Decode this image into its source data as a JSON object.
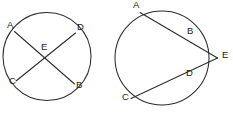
{
  "figure": {
    "background_color": "#ffffff",
    "stroke_color": "#2b2b2b",
    "label_color": "#1a1a1a",
    "canvas": {
      "width": 233,
      "height": 113
    }
  },
  "left_diagram": {
    "name": "intersecting-chords-circle",
    "circle": {
      "cx": 47,
      "cy": 56.5,
      "r": 44
    },
    "chords": [
      {
        "name": "chord-AB",
        "from": {
          "point": "A",
          "x": 14.5,
          "y": 31.5
        },
        "to": {
          "point": "B",
          "x": 74.5,
          "y": 84.0
        }
      },
      {
        "name": "chord-CD",
        "from": {
          "point": "C",
          "x": 16.0,
          "y": 81.0
        },
        "to": {
          "point": "D",
          "x": 75.5,
          "y": 33.0
        }
      }
    ],
    "intersection": {
      "point": "E",
      "x": 45.0,
      "y": 57.0
    },
    "labels": [
      {
        "text": "A",
        "x": 7,
        "y": 21
      },
      {
        "text": "D",
        "x": 77,
        "y": 23
      },
      {
        "text": "E",
        "x": 41,
        "y": 43
      },
      {
        "text": "C",
        "x": 9,
        "y": 77
      },
      {
        "text": "B",
        "x": 76,
        "y": 81
      }
    ]
  },
  "right_diagram": {
    "name": "two-secants-external-point-circle",
    "circle": {
      "cx": 162,
      "cy": 58,
      "r": 47
    },
    "external_point": {
      "point": "E",
      "x": 217.5,
      "y": 58.0
    },
    "secants": [
      {
        "name": "secant-AE-through-B",
        "near": {
          "point": "B",
          "x": 187.0,
          "y": 38.5
        },
        "far": {
          "point": "A",
          "x": 140.0,
          "y": 12.5
        }
      },
      {
        "name": "secant-CE-through-D",
        "near": {
          "point": "D",
          "x": 187.0,
          "y": 78.5
        },
        "far": {
          "point": "C",
          "x": 131.0,
          "y": 98.5
        }
      }
    ],
    "labels": [
      {
        "text": "A",
        "x": 133,
        "y": 1
      },
      {
        "text": "B",
        "x": 187,
        "y": 27
      },
      {
        "text": "E",
        "x": 222,
        "y": 51
      },
      {
        "text": "D",
        "x": 186,
        "y": 69
      },
      {
        "text": "C",
        "x": 122,
        "y": 93
      }
    ]
  }
}
